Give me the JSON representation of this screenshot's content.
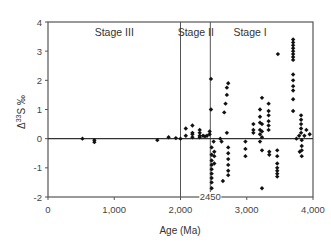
{
  "chart_data": {
    "type": "scatter",
    "title": "",
    "xlabel": "Age (Ma)",
    "ylabel": "Δ33S ‰",
    "ylabel_parts": {
      "prefix": "Δ",
      "sup": "33",
      "main": "S ‰"
    },
    "xlim": [
      0,
      4000
    ],
    "ylim": [
      -2,
      4
    ],
    "x_ticks": [
      0,
      1000,
      2000,
      3000,
      4000
    ],
    "x_tick_labels": [
      "0",
      "1,000",
      "2,000",
      "3,000",
      "4,000"
    ],
    "y_ticks": [
      -2,
      -1,
      0,
      1,
      2,
      3,
      4
    ],
    "y_tick_labels": [
      "-2",
      "-1",
      "0",
      "1",
      "2",
      "3",
      "4"
    ],
    "grid": false,
    "legend": null,
    "zero_line": true,
    "vertical_lines": [
      2000,
      2450
    ],
    "annotations": [
      {
        "text": "Stage III",
        "x": 1000,
        "y": 3.6
      },
      {
        "text": "Stage II",
        "x": 2230,
        "y": 3.6
      },
      {
        "text": "Stage I",
        "x": 3050,
        "y": 3.6
      },
      {
        "text": "2450",
        "x": 2450,
        "y": -2.05
      }
    ],
    "series": [
      {
        "name": "Δ33S samples",
        "marker": "diamond",
        "color": "#111111",
        "points": [
          [
            520,
            0.0
          ],
          [
            700,
            -0.05
          ],
          [
            700,
            -0.12
          ],
          [
            1650,
            -0.05
          ],
          [
            1820,
            0.05
          ],
          [
            1930,
            0.02
          ],
          [
            2000,
            0.0
          ],
          [
            2080,
            0.1
          ],
          [
            2080,
            0.35
          ],
          [
            2180,
            0.05
          ],
          [
            2180,
            0.15
          ],
          [
            2180,
            0.2
          ],
          [
            2180,
            0.45
          ],
          [
            2290,
            0.05
          ],
          [
            2290,
            0.1
          ],
          [
            2290,
            0.2
          ],
          [
            2290,
            0.3
          ],
          [
            2340,
            0.1
          ],
          [
            2370,
            0.08
          ],
          [
            2400,
            0.1
          ],
          [
            2440,
            0.25
          ],
          [
            2440,
            0.15
          ],
          [
            2460,
            1.0
          ],
          [
            2460,
            2.05
          ],
          [
            2470,
            -0.3
          ],
          [
            2470,
            -0.55
          ],
          [
            2470,
            -0.75
          ],
          [
            2470,
            -0.9
          ],
          [
            2470,
            -1.05
          ],
          [
            2470,
            -1.2
          ],
          [
            2470,
            -1.35
          ],
          [
            2470,
            -1.5
          ],
          [
            2470,
            -1.7
          ],
          [
            2470,
            -1.9
          ],
          [
            2500,
            -0.1
          ],
          [
            2510,
            -0.45
          ],
          [
            2510,
            -0.6
          ],
          [
            2510,
            -0.85
          ],
          [
            2600,
            0.0
          ],
          [
            2620,
            -0.1
          ],
          [
            2640,
            -1.45
          ],
          [
            2660,
            0.9
          ],
          [
            2680,
            1.2
          ],
          [
            2700,
            1.5
          ],
          [
            2700,
            1.75
          ],
          [
            2720,
            1.9
          ],
          [
            2700,
            0.2
          ],
          [
            2720,
            -0.3
          ],
          [
            2720,
            -0.5
          ],
          [
            2720,
            -0.7
          ],
          [
            2720,
            -0.9
          ],
          [
            2720,
            -1.1
          ],
          [
            2720,
            -1.25
          ],
          [
            2980,
            -0.1
          ],
          [
            2980,
            -0.35
          ],
          [
            2980,
            -0.6
          ],
          [
            3100,
            0.5
          ],
          [
            3100,
            0.3
          ],
          [
            3100,
            0.2
          ],
          [
            3200,
            1.0
          ],
          [
            3200,
            0.75
          ],
          [
            3200,
            0.55
          ],
          [
            3200,
            0.3
          ],
          [
            3200,
            0.15
          ],
          [
            3200,
            -0.1
          ],
          [
            3230,
            1.4
          ],
          [
            3230,
            0.5
          ],
          [
            3230,
            0.25
          ],
          [
            3230,
            0.05
          ],
          [
            3230,
            -0.4
          ],
          [
            3230,
            -1.7
          ],
          [
            3330,
            1.2
          ],
          [
            3330,
            0.95
          ],
          [
            3330,
            0.8
          ],
          [
            3330,
            0.6
          ],
          [
            3330,
            0.45
          ],
          [
            3330,
            0.3
          ],
          [
            3340,
            -0.45
          ],
          [
            3340,
            -0.55
          ],
          [
            3470,
            2.9
          ],
          [
            3460,
            -0.4
          ],
          [
            3460,
            -0.6
          ],
          [
            3460,
            -0.85
          ],
          [
            3460,
            -1.0
          ],
          [
            3460,
            -1.1
          ],
          [
            3460,
            -1.2
          ],
          [
            3460,
            -1.3
          ],
          [
            3700,
            3.4
          ],
          [
            3700,
            3.3
          ],
          [
            3700,
            3.2
          ],
          [
            3700,
            3.1
          ],
          [
            3700,
            3.0
          ],
          [
            3700,
            2.9
          ],
          [
            3700,
            2.8
          ],
          [
            3700,
            2.7
          ],
          [
            3700,
            2.2
          ],
          [
            3700,
            2.0
          ],
          [
            3700,
            1.8
          ],
          [
            3700,
            1.65
          ],
          [
            3700,
            1.35
          ],
          [
            3700,
            0.95
          ],
          [
            3750,
            0.0
          ],
          [
            3790,
            0.1
          ],
          [
            3800,
            -0.45
          ],
          [
            3820,
            0.8
          ],
          [
            3820,
            0.65
          ],
          [
            3820,
            0.5
          ],
          [
            3820,
            0.35
          ],
          [
            3820,
            0.2
          ],
          [
            3830,
            -0.05
          ],
          [
            3830,
            -0.25
          ],
          [
            3830,
            -0.4
          ],
          [
            3830,
            -0.6
          ],
          [
            3870,
            0.1
          ],
          [
            3900,
            0.3
          ],
          [
            3950,
            0.15
          ]
        ]
      }
    ]
  }
}
